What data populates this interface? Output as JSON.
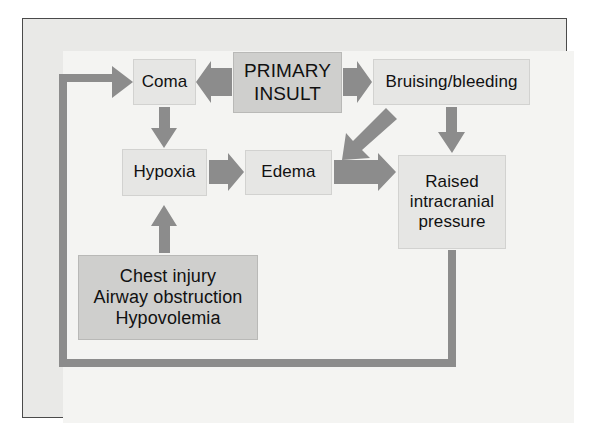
{
  "figure": {
    "type": "flowchart",
    "palette": {
      "page_background": "#ffffff",
      "plate_background": "#e9e9e7",
      "panel_background": "#f4f4f2",
      "plate_border": "#4a4a4a",
      "node_fill_light": "#e6e6e4",
      "node_fill_dark": "#cfcfcd",
      "node_border": "#d2d2d0",
      "arrow_color": "#8c8c8c",
      "loop_color": "#8c8c8c",
      "text_color": "#111111"
    }
  },
  "nodes": {
    "coma": {
      "label": "Coma",
      "shade": "light"
    },
    "primary_insult": {
      "line1": "PRIMARY",
      "line2": "INSULT",
      "shade": "dark"
    },
    "bruising": {
      "label": "Bruising/bleeding",
      "shade": "light"
    },
    "hypoxia": {
      "label": "Hypoxia",
      "shade": "light"
    },
    "edema": {
      "label": "Edema",
      "shade": "light"
    },
    "raised_icp": {
      "line1": "Raised",
      "line2": "intracranial",
      "line3": "pressure",
      "shade": "light"
    },
    "chest": {
      "line1": "Chest injury",
      "line2": "Airway obstruction",
      "line3": "Hypovolemia",
      "shade": "dark"
    }
  },
  "edges": [
    {
      "id": "primary-to-coma",
      "from": "primary_insult",
      "to": "coma",
      "style": "straight-arrow",
      "direction": "left"
    },
    {
      "id": "primary-to-bruising",
      "from": "primary_insult",
      "to": "bruising",
      "style": "straight-arrow",
      "direction": "right"
    },
    {
      "id": "primary-to-edema-diagonal",
      "from": "primary_insult",
      "to": "edema",
      "style": "diagonal-arrow",
      "direction": "down-left"
    },
    {
      "id": "coma-to-hypoxia",
      "from": "coma",
      "to": "hypoxia",
      "style": "straight-arrow",
      "direction": "down"
    },
    {
      "id": "hypoxia-to-edema",
      "from": "hypoxia",
      "to": "edema",
      "style": "straight-arrow",
      "direction": "right"
    },
    {
      "id": "edema-to-raised-icp",
      "from": "edema",
      "to": "raised_icp",
      "style": "straight-arrow",
      "direction": "right"
    },
    {
      "id": "bruising-to-raised-icp",
      "from": "bruising",
      "to": "raised_icp",
      "style": "straight-arrow",
      "direction": "down"
    },
    {
      "id": "chest-to-hypoxia",
      "from": "chest",
      "to": "hypoxia",
      "style": "straight-arrow",
      "direction": "up"
    },
    {
      "id": "raised-icp-to-coma-feedback",
      "from": "raised_icp",
      "to": "coma",
      "style": "elbow-loop",
      "direction": "down-left-up-right"
    }
  ]
}
